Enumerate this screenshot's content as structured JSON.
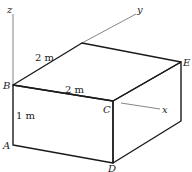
{
  "diagram": {
    "type": "isometric-box",
    "points": {
      "A": "A",
      "B": "B",
      "C": "C",
      "D": "D",
      "E": "E"
    },
    "axes": {
      "x": "x",
      "y": "y",
      "z": "z"
    },
    "dimensions": {
      "depth": "2 m",
      "width": "2 m",
      "height": "1 m"
    },
    "colors": {
      "edge": "#1a1a1a",
      "axis": "#555555"
    }
  }
}
